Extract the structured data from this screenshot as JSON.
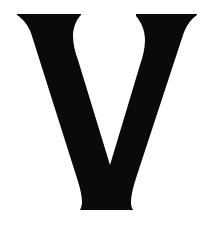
{
  "glyph": {
    "character": "V",
    "style": "serif-capital",
    "fill_color": "#0a0a0a",
    "background_color": "#ffffff"
  }
}
